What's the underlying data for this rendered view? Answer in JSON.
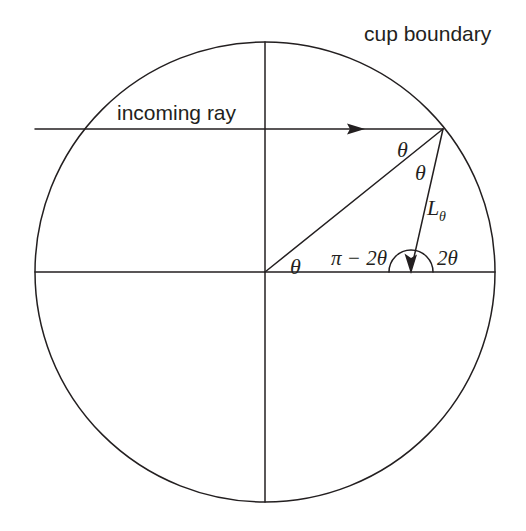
{
  "figure": {
    "title_text": "cup boundary",
    "labels": {
      "cup_boundary": "cup boundary",
      "incoming_ray": "incoming ray",
      "theta_incidence": "θ",
      "theta_reflection": "θ",
      "theta_center": "θ",
      "chord_length_base": "L",
      "chord_length_sub": "θ",
      "pi_minus_2theta": "π − 2θ",
      "two_theta": "2θ"
    },
    "colors": {
      "ink": "#231f20",
      "background": "#ffffff"
    },
    "geometry": {
      "circle_center_x": 265,
      "circle_center_y": 272,
      "circle_radius": 230,
      "impact_point_x": 443,
      "impact_point_y": 129,
      "incoming_ray_start_x": 35,
      "incoming_ray_y": 129,
      "incoming_arrow_tip_x": 363,
      "reflected_end_x": 411,
      "reflected_end_y": 272,
      "angle_arc_radius": 22,
      "theta_degrees": 38.6
    }
  }
}
